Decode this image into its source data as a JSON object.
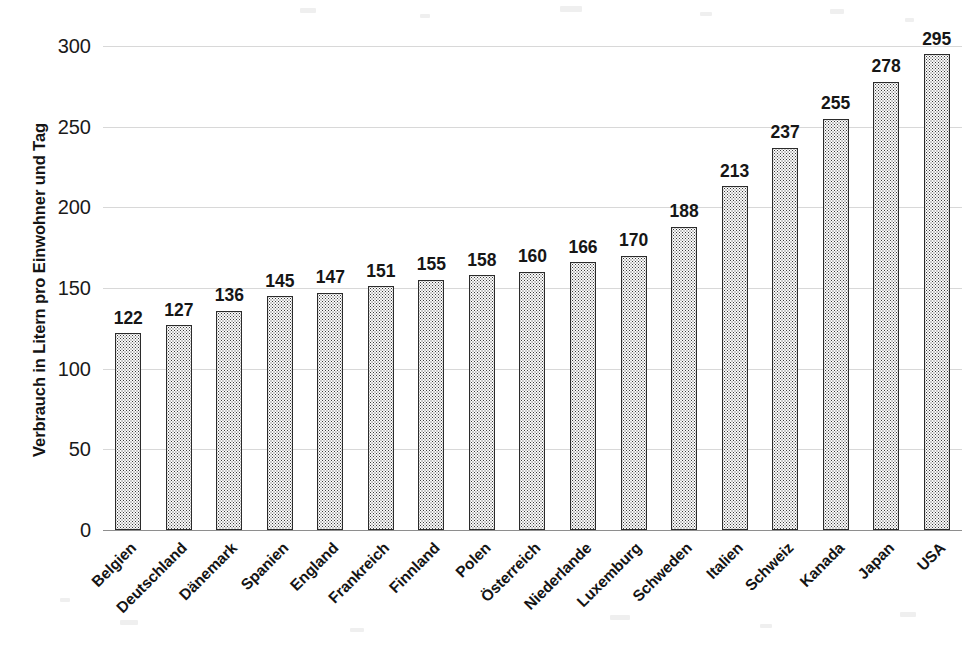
{
  "chart_data": {
    "type": "bar",
    "title": "",
    "subtitle": "",
    "xlabel": "",
    "ylabel": "Verbrauch in Litern pro Einwohner und Tag",
    "ylim": [
      0,
      300
    ],
    "yticks": [
      0,
      50,
      100,
      150,
      200,
      250,
      300
    ],
    "ytick_labels": [
      "0",
      "50",
      "100",
      "150",
      "200",
      "250",
      "300"
    ],
    "grid": true,
    "legend": false,
    "legend_position": "none",
    "value_labels": true,
    "categories": [
      "Belgien",
      "Deutschland",
      "Dänemark",
      "Spanien",
      "England",
      "Frankreich",
      "Finnland",
      "Polen",
      "Österreich",
      "Niederlande",
      "Luxemburg",
      "Schweden",
      "Italien",
      "Schweiz",
      "Kanada",
      "Japan",
      "USA"
    ],
    "values": [
      122,
      127,
      136,
      145,
      147,
      151,
      155,
      158,
      160,
      166,
      170,
      188,
      213,
      237,
      255,
      278,
      295
    ],
    "value_label_texts": [
      "122",
      "127",
      "136",
      "145",
      "147",
      "151",
      "155",
      "158",
      "160",
      "166",
      "170",
      "188",
      "213",
      "237",
      "255",
      "278",
      "295"
    ],
    "series": [
      {
        "name": "Verbrauch",
        "values": [
          122,
          127,
          136,
          145,
          147,
          151,
          155,
          158,
          160,
          166,
          170,
          188,
          213,
          237,
          255,
          278,
          295
        ]
      }
    ]
  },
  "style": {
    "bar_fill": "#fbfbfb",
    "bar_pattern": "fine-dotted",
    "bar_outline": "#2b2b2b",
    "gridline_color": "#d8d8d8",
    "axis_color": "#8e8e8e",
    "text_color": "#1a1a1a",
    "background": "#ffffff"
  }
}
